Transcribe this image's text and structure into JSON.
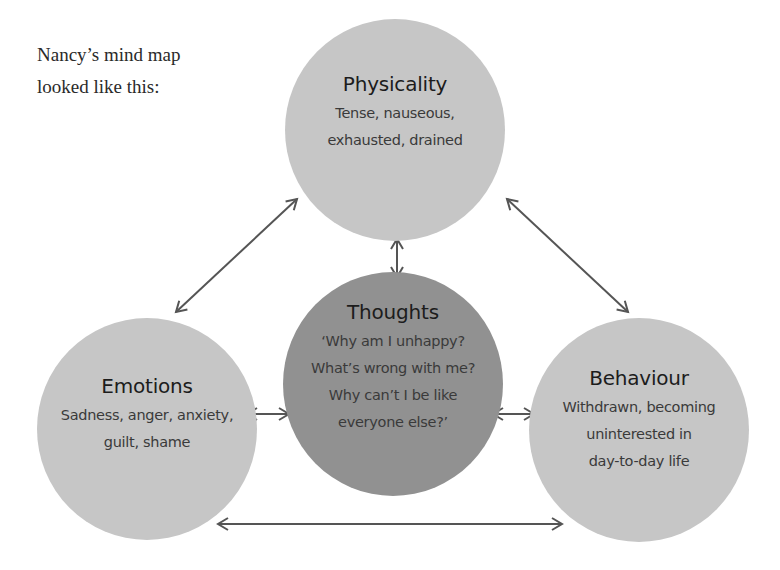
{
  "intro": {
    "line1": "Nancy’s mind map",
    "line2": "looked like this:"
  },
  "nodes": {
    "physicality": {
      "title": "Physicality",
      "lines": [
        "Tense, nauseous,",
        "exhausted, drained"
      ]
    },
    "thoughts": {
      "title": "Thoughts",
      "lines": [
        "‘Why am I unhappy?",
        "What’s wrong with me?",
        "Why can’t I be like",
        "everyone else?’"
      ]
    },
    "emotions": {
      "title": "Emotions",
      "lines": [
        "Sadness, anger, anxiety,",
        "guilt, shame"
      ]
    },
    "behaviour": {
      "title": "Behaviour",
      "lines": [
        "Withdrawn, becoming",
        "uninterested in",
        "day-to-day life"
      ]
    }
  },
  "connections": [
    {
      "from": "physicality",
      "to": "emotions",
      "type": "bidirectional"
    },
    {
      "from": "physicality",
      "to": "behaviour",
      "type": "bidirectional"
    },
    {
      "from": "physicality",
      "to": "thoughts",
      "type": "bidirectional"
    },
    {
      "from": "emotions",
      "to": "thoughts",
      "type": "bidirectional"
    },
    {
      "from": "thoughts",
      "to": "behaviour",
      "type": "bidirectional"
    },
    {
      "from": "emotions",
      "to": "behaviour",
      "type": "bidirectional"
    }
  ],
  "colors": {
    "outer_node": "#c6c6c6",
    "center_node": "#919191",
    "arrow": "#555555",
    "text": "#1c1c1c"
  }
}
